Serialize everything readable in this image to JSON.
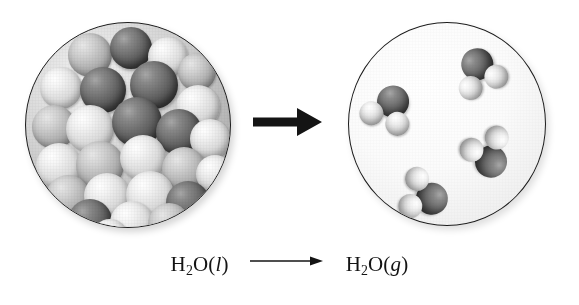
{
  "figure": {
    "type": "chemistry-phase-change-diagram",
    "title": "",
    "background_color": "#ffffff"
  },
  "caption": {
    "reactant": {
      "formula": "H",
      "subscript": "2",
      "element": "O",
      "state_open": "(",
      "state": "l",
      "state_close": ")"
    },
    "product": {
      "formula": "H",
      "subscript": "2",
      "element": "O",
      "state_open": "(",
      "state": "g",
      "state_close": ")"
    },
    "arrow_glyph": "⟶",
    "full_text": "H2O(l) ⟶ H2O(g)"
  },
  "panels": [
    {
      "id": "liquid",
      "name": "liquid-water-panel",
      "phase_label": "liquid",
      "molecule_count_visible": 26,
      "packing": "dense",
      "circle": {
        "x": 25,
        "y": 22,
        "diameter": 206
      },
      "border_color": "#1c1c1c"
    },
    {
      "id": "gas",
      "name": "water-vapor-panel",
      "phase_label": "gas",
      "molecule_count_visible": 4,
      "packing": "sparse",
      "circle": {
        "x": 348,
        "y": 22,
        "diameter": 198
      },
      "border_color": "#1c1c1c"
    }
  ],
  "arrow": {
    "name": "phase-change-arrow",
    "direction": "right",
    "color": "#141414"
  },
  "atoms": {
    "oxygen": {
      "label": "O",
      "shade": "dark-gray",
      "color": "#4b4b4b"
    },
    "hydrogen": {
      "label": "H",
      "shade": "light-gray",
      "color": "#e4e4e4"
    }
  },
  "gas_molecules": [
    {
      "name": "water-molecule-1",
      "x": 104,
      "y": 24,
      "rotation": -28
    },
    {
      "name": "water-molecule-2",
      "x": 12,
      "y": 62,
      "rotation": 18
    },
    {
      "name": "water-molecule-3",
      "x": 108,
      "y": 104,
      "rotation": 150
    },
    {
      "name": "water-molecule-4",
      "x": 44,
      "y": 148,
      "rotation": 100
    }
  ],
  "liquid_molecules": [
    {
      "x": 42,
      "y": 10,
      "r": 22,
      "t": "m"
    },
    {
      "x": 84,
      "y": 4,
      "r": 21,
      "t": "o"
    },
    {
      "x": 122,
      "y": 14,
      "r": 20,
      "t": "h"
    },
    {
      "x": 152,
      "y": 30,
      "r": 19,
      "t": "m"
    },
    {
      "x": 14,
      "y": 44,
      "r": 21,
      "t": "h"
    },
    {
      "x": 54,
      "y": 44,
      "r": 23,
      "t": "o"
    },
    {
      "x": 104,
      "y": 38,
      "r": 24,
      "t": "o"
    },
    {
      "x": 150,
      "y": 62,
      "r": 22,
      "t": "h"
    },
    {
      "x": 6,
      "y": 82,
      "r": 22,
      "t": "m"
    },
    {
      "x": 40,
      "y": 82,
      "r": 24,
      "t": "h"
    },
    {
      "x": 86,
      "y": 74,
      "r": 25,
      "t": "o"
    },
    {
      "x": 130,
      "y": 86,
      "r": 23,
      "t": "o"
    },
    {
      "x": 164,
      "y": 96,
      "r": 20,
      "t": "h"
    },
    {
      "x": 10,
      "y": 120,
      "r": 23,
      "t": "h"
    },
    {
      "x": 50,
      "y": 118,
      "r": 24,
      "t": "m"
    },
    {
      "x": 94,
      "y": 112,
      "r": 23,
      "t": "h"
    },
    {
      "x": 136,
      "y": 124,
      "r": 22,
      "t": "m"
    },
    {
      "x": 170,
      "y": 132,
      "r": 19,
      "t": "h"
    },
    {
      "x": 20,
      "y": 152,
      "r": 22,
      "t": "m"
    },
    {
      "x": 58,
      "y": 150,
      "r": 23,
      "t": "h"
    },
    {
      "x": 100,
      "y": 148,
      "r": 24,
      "t": "h"
    },
    {
      "x": 140,
      "y": 158,
      "r": 22,
      "t": "o"
    },
    {
      "x": 42,
      "y": 176,
      "r": 22,
      "t": "o"
    },
    {
      "x": 84,
      "y": 178,
      "r": 22,
      "t": "h"
    },
    {
      "x": 122,
      "y": 180,
      "r": 21,
      "t": "m"
    },
    {
      "x": 66,
      "y": 196,
      "r": 18,
      "t": "h"
    }
  ]
}
